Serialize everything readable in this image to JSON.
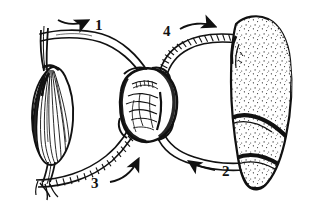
{
  "figure": {
    "caption": "",
    "background_color": "#ffffff",
    "ink_color": "#111111",
    "style": "black-and-white pen-and-ink line drawing"
  },
  "labels": [
    {
      "id": "label-1",
      "text": "1",
      "x": 95,
      "y": 30,
      "arrow_direction": "left",
      "arrow_description": "curved arrow above upper-left smooth vessel, pointing left toward the striated spindle organ"
    },
    {
      "id": "label-2",
      "text": "2",
      "x": 229,
      "y": 172,
      "arrow_direction": "left",
      "arrow_description": "curved arrow below lower-right smooth vessel, pointing left toward the central organ"
    },
    {
      "id": "label-3",
      "text": "3",
      "x": 96,
      "y": 183,
      "arrow_direction": "up-right",
      "arrow_description": "curved arrow below lower-left ribbed vessel, pointing up and right toward the central organ"
    },
    {
      "id": "label-4",
      "text": "4",
      "x": 169,
      "y": 31,
      "arrow_direction": "right",
      "arrow_description": "curved arrow above upper-right ribbed vessel, pointing right toward the large stippled organ"
    }
  ],
  "organs": [
    {
      "id": "left-organ",
      "name": "striated spindle organ",
      "texture": "fine longitudinal striations / hatched fibers",
      "position": "left"
    },
    {
      "id": "center-organ",
      "name": "central heart-like organ",
      "texture": "irregular scribbled interior with dark outline ring",
      "position": "center"
    },
    {
      "id": "right-organ",
      "name": "large stippled organ",
      "texture": "dense stippling with dark transverse ridges",
      "position": "right"
    }
  ],
  "vessels": [
    {
      "id": "vessel-upper-left",
      "name": "upper-left smooth vessel",
      "texture": "smooth double line",
      "connects": [
        "left-organ",
        "center-organ"
      ],
      "flow_label": "1"
    },
    {
      "id": "vessel-lower-left",
      "name": "lower-left ribbed vessel",
      "texture": "segmented / ribbed",
      "connects": [
        "left-organ",
        "center-organ"
      ],
      "flow_label": "3"
    },
    {
      "id": "vessel-upper-right",
      "name": "upper-right ribbed vessel",
      "texture": "segmented / ribbed",
      "connects": [
        "center-organ",
        "right-organ"
      ],
      "flow_label": "4"
    },
    {
      "id": "vessel-lower-right",
      "name": "lower-right smooth vessel",
      "texture": "smooth double line",
      "connects": [
        "right-organ",
        "center-organ"
      ],
      "flow_label": "2"
    }
  ]
}
